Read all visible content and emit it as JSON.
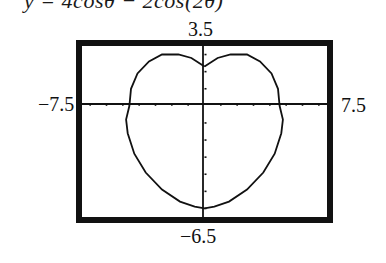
{
  "title": "y = 4cosθ − 2cos(2θ)",
  "window": {
    "xmin_label": "−7.5",
    "xmax_label": "7.5",
    "ymax_label": "3.5",
    "ymin_label": "−6.5"
  },
  "chart_data": {
    "type": "line",
    "xlabel": "",
    "ylabel": "",
    "xlim": [
      -7.5,
      7.5
    ],
    "ylim": [
      -6.5,
      3.5
    ],
    "xscale_ticks": 1,
    "yscale_ticks": 1,
    "grid": false,
    "axes": true,
    "frame": "thick black border (calculator screen)",
    "curve_description": "Closed heart-shaped (cardioid-like) polar curve with a cusp/dimple at the top on the y-axis near y≈2.2, top lobes near y≈3.0, crossing x-axis at x≈±4.6, widest near x≈±5.0 at y≈−1, bottom near y≈−6.0",
    "series": [
      {
        "name": "polar curve",
        "points": [
          [
            0,
            2.3
          ],
          [
            0.8,
            2.8
          ],
          [
            1.6,
            3.0
          ],
          [
            2.6,
            3.0
          ],
          [
            3.4,
            2.6
          ],
          [
            4.1,
            1.9
          ],
          [
            4.5,
            1.0
          ],
          [
            4.6,
            0.0
          ],
          [
            4.8,
            -0.8
          ],
          [
            4.7,
            -1.6
          ],
          [
            4.3,
            -2.8
          ],
          [
            3.6,
            -3.9
          ],
          [
            2.6,
            -4.9
          ],
          [
            1.5,
            -5.6
          ],
          [
            0.6,
            -5.9
          ],
          [
            0,
            -6.0
          ],
          [
            -0.6,
            -5.9
          ],
          [
            -1.5,
            -5.6
          ],
          [
            -2.6,
            -4.9
          ],
          [
            -3.6,
            -3.9
          ],
          [
            -4.3,
            -2.8
          ],
          [
            -4.7,
            -1.6
          ],
          [
            -4.8,
            -0.8
          ],
          [
            -4.6,
            0.0
          ],
          [
            -4.5,
            1.0
          ],
          [
            -4.1,
            1.9
          ],
          [
            -3.4,
            2.6
          ],
          [
            -2.6,
            3.0
          ],
          [
            -1.6,
            3.0
          ],
          [
            -0.8,
            2.8
          ],
          [
            0,
            2.3
          ]
        ]
      }
    ]
  },
  "colors": {
    "ink": "#111111",
    "background": "#ffffff"
  }
}
